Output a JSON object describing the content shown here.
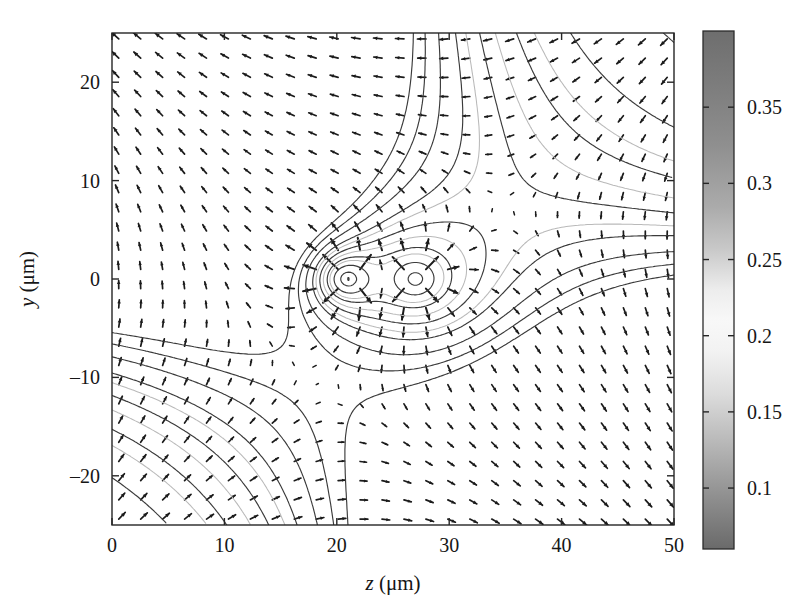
{
  "figure": {
    "type": "quiver-contour",
    "background": "#ffffff"
  },
  "axes": {
    "x": {
      "label_var": "z",
      "label_unit": " (μm)",
      "ticks": [
        "0",
        "10",
        "20",
        "30",
        "40",
        "50"
      ],
      "tick_values": [
        0,
        10,
        20,
        30,
        40,
        50
      ],
      "range": [
        0,
        50
      ]
    },
    "y": {
      "label_var": "y",
      "label_unit": " (μm)",
      "ticks": [
        "20",
        "10",
        "0",
        "–10",
        "–20"
      ],
      "tick_values": [
        20,
        10,
        0,
        -10,
        -20
      ],
      "range": [
        -25,
        25
      ]
    }
  },
  "colorbar": {
    "orientation": "vertical",
    "position": "right",
    "ticks": [
      "0.35",
      "0.3",
      "0.25",
      "0.2",
      "0.15",
      "0.1"
    ],
    "tick_values": [
      0.35,
      0.3,
      0.25,
      0.2,
      0.15,
      0.1
    ],
    "range": [
      0.06,
      0.4
    ],
    "colormap": "grayscale-diverging",
    "stops": [
      {
        "pos": 0.0,
        "color": "#6e6e6e"
      },
      {
        "pos": 0.1,
        "color": "#7c7c7c"
      },
      {
        "pos": 0.22,
        "color": "#8f8f8f"
      },
      {
        "pos": 0.34,
        "color": "#ababab"
      },
      {
        "pos": 0.42,
        "color": "#c8c8c8"
      },
      {
        "pos": 0.5,
        "color": "#ededed"
      },
      {
        "pos": 0.56,
        "color": "#f8f8f8"
      },
      {
        "pos": 0.62,
        "color": "#f2f2f2"
      },
      {
        "pos": 0.7,
        "color": "#dcdcdc"
      },
      {
        "pos": 0.8,
        "color": "#b6b6b6"
      },
      {
        "pos": 0.9,
        "color": "#8f8f8f"
      },
      {
        "pos": 1.0,
        "color": "#6a6a6a"
      }
    ]
  },
  "chart_data": {
    "type": "scatter",
    "title": "",
    "xlabel": "z (μm)",
    "ylabel": "y (μm)",
    "xlim": [
      0,
      50
    ],
    "ylim": [
      -25,
      25
    ],
    "grid": false,
    "legend": "none",
    "colorbar_label": "",
    "colorbar_lim": [
      0.06,
      0.4
    ],
    "features": {
      "focus_points": [
        {
          "z": 21.0,
          "y": 0.0,
          "kind": "closed-contour-center"
        },
        {
          "z": 27.0,
          "y": 0.0,
          "kind": "closed-contour-center"
        }
      ],
      "closed_blobs": [
        {
          "z": 31.0,
          "y": 8.0
        },
        {
          "z": 31.0,
          "y": -7.5
        }
      ],
      "quiver_grid": {
        "nx": 26,
        "ny": 26,
        "x_start": 0.6,
        "x_end": 49.4,
        "y_start": -24.4,
        "y_end": 24.4
      }
    }
  }
}
